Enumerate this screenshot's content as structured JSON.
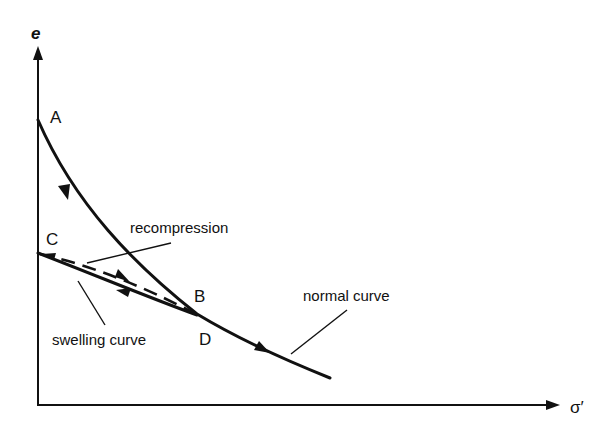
{
  "diagram": {
    "axes": {
      "y_label": "e",
      "x_label": "σ′"
    },
    "points": {
      "A": "A",
      "B": "B",
      "C": "C",
      "D": "D"
    },
    "annotations": {
      "recompression": "recompression",
      "swelling_curve": "swelling curve",
      "normal_curve": "normal curve"
    },
    "paths": [
      {
        "name": "normal-curve",
        "from": "A",
        "via": "B/D",
        "style": "solid",
        "direction": "A→D→beyond"
      },
      {
        "name": "swelling-curve",
        "from": "D",
        "to": "C",
        "style": "solid",
        "direction": "D→C"
      },
      {
        "name": "recompression-curve",
        "from": "C",
        "to": "B",
        "style": "dashed",
        "direction": "C→B"
      }
    ],
    "colors": {
      "ink": "#111111",
      "background": "#ffffff"
    }
  }
}
